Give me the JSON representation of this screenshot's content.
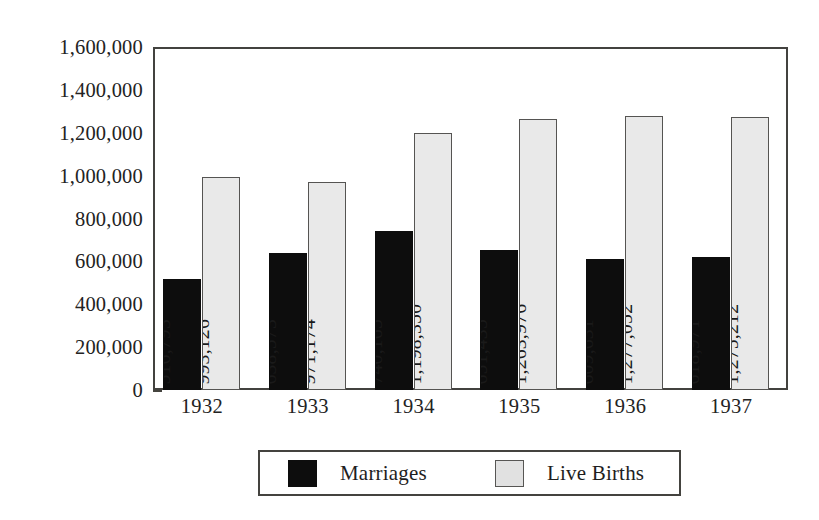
{
  "chart_data": {
    "type": "bar",
    "title": "",
    "subtitle": "",
    "xlabel": "",
    "ylabel": "",
    "categories": [
      "1932",
      "1933",
      "1934",
      "1935",
      "1936",
      "1937"
    ],
    "series": [
      {
        "name": "Marriages",
        "color": "#0d0d0d",
        "values": [
          516793,
          638573,
          740165,
          651435,
          609631,
          618971
        ],
        "value_labels": [
          "516,793",
          "638,573",
          "740,165",
          "651,435",
          "609,631",
          "618,971"
        ]
      },
      {
        "name": "Live Births",
        "color": "#e9e9e9",
        "values": [
          993126,
          971174,
          1198350,
          1263976,
          1277052,
          1275212
        ],
        "value_labels": [
          "993,126",
          "971,174",
          "1,198,350",
          "1,263,976",
          "1,277,052",
          "1,275,212"
        ]
      }
    ],
    "ylim": [
      0,
      1600000
    ],
    "ytick_step": 200000,
    "yminor_step": 100000,
    "ytick_labels": [
      "1,600,000",
      "1,400,000",
      "1,200,000",
      "1,000,000",
      "800,000",
      "600,000",
      "400,000",
      "200,000",
      "0"
    ],
    "ytick_values": [
      1600000,
      1400000,
      1200000,
      1000000,
      800000,
      600000,
      400000,
      200000,
      0
    ],
    "grid": false,
    "legend_position": "bottom",
    "value_label_rotation": 90,
    "frame_color": "#43423f"
  },
  "legend": {
    "entries": [
      {
        "label": "Marriages",
        "swatch": "dark-swatch-icon"
      },
      {
        "label": "Live Births",
        "swatch": "light-swatch-icon"
      }
    ]
  }
}
